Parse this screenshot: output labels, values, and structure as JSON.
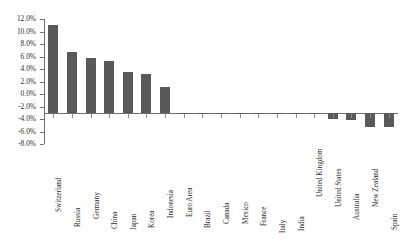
{
  "chart_data": {
    "type": "bar",
    "title": "",
    "subtitle": "",
    "xlabel": "",
    "ylabel": "",
    "ylim": [
      -8.0,
      12.0
    ],
    "ytick_step": 2.0,
    "ytick_labels": [
      "12.0%",
      "10.0%",
      "8.0%",
      "6.0%",
      "4.0%",
      "2.0%",
      "0.0%",
      "-2.0%",
      "-4.0%",
      "-6.0%",
      "-8.0%"
    ],
    "ytick_values": [
      12.0,
      10.0,
      8.0,
      6.0,
      4.0,
      2.0,
      0.0,
      -2.0,
      -4.0,
      -6.0,
      -8.0
    ],
    "grid": false,
    "legend": null,
    "value_suffix": "%",
    "bar_color": "#595959",
    "axis_color": "#6f6f6f",
    "categories": [
      "Switzerland",
      "Russia",
      "Germany",
      "China",
      "Japan",
      "Korea",
      "Indonesia",
      "Euro Area",
      "Brazil",
      "Canada",
      "Mexico",
      "France",
      "Italy",
      "India",
      "United Kingdom",
      "United States",
      "Australia",
      "New Zealand",
      "Spain"
    ],
    "values": [
      11.0,
      6.8,
      5.7,
      5.3,
      3.5,
      3.2,
      1.2,
      -0.3,
      -0.6,
      -0.8,
      -0.9,
      -1.3,
      -1.6,
      -2.0,
      -2.4,
      -4.0,
      -4.1,
      -5.2,
      -5.2
    ]
  }
}
